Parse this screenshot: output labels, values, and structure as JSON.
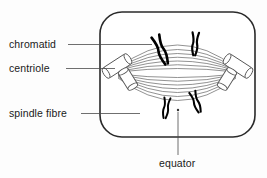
{
  "figure": {
    "background_color": "#fdfdfd",
    "outline_color": "#2a2a2a",
    "spindle_color": "#6e6e6e",
    "chromatid_color": "#000000",
    "leader_color": "#4a4a4a"
  },
  "labels": {
    "chromatid": "chromatid",
    "centriole": "centriole",
    "spindle_fibre": "spindle fibre",
    "equator": "equator"
  },
  "label_positions": {
    "chromatid": {
      "x": 9,
      "y": 48
    },
    "centriole": {
      "x": 9,
      "y": 72
    },
    "spindle_fibre": {
      "x": 9,
      "y": 117
    },
    "equator": {
      "x": 159,
      "y": 167
    }
  },
  "leader_lines": {
    "chromatid": {
      "x1": 68,
      "y1": 44.5,
      "x2": 152,
      "y2": 44.5
    },
    "centriole": {
      "x1": 66,
      "y1": 68.5,
      "x2": 115,
      "y2": 68.5
    },
    "spindle_fibre": {
      "x1": 81,
      "y1": 113.5,
      "x2": 140,
      "y2": 113.5
    },
    "equator": {
      "x1": 178,
      "y1": 155,
      "x2": 178,
      "y2": 112
    }
  },
  "cell": {
    "x": 100,
    "y": 12,
    "width": 155,
    "height": 125,
    "corner_radius": 22
  },
  "poles": {
    "left": {
      "x": 114,
      "y": 73
    },
    "right": {
      "x": 240,
      "y": 73
    }
  },
  "equator_point": {
    "x": 178,
    "y": 110
  },
  "spindle_fibres": {
    "count": 14,
    "description": "arcs spanning left pole to right pole, fanning above and below the equator"
  },
  "chromosomes": [
    {
      "id": "chromosome-upper-left",
      "cx": 161,
      "cy": 50,
      "angle": -22,
      "scale": 1.15
    },
    {
      "id": "chromosome-upper-right",
      "cx": 195,
      "cy": 44,
      "angle": 4,
      "scale": 0.95
    },
    {
      "id": "chromosome-lower-left",
      "cx": 166,
      "cy": 108,
      "angle": 8,
      "scale": 0.85
    },
    {
      "id": "chromosome-lower-right",
      "cx": 196,
      "cy": 102,
      "angle": -20,
      "scale": 0.9
    }
  ],
  "centrioles": [
    {
      "id": "centriole-left",
      "cx": 120,
      "cy": 72,
      "mirrored": false
    },
    {
      "id": "centriole-right",
      "cx": 235,
      "cy": 72,
      "mirrored": true
    }
  ]
}
